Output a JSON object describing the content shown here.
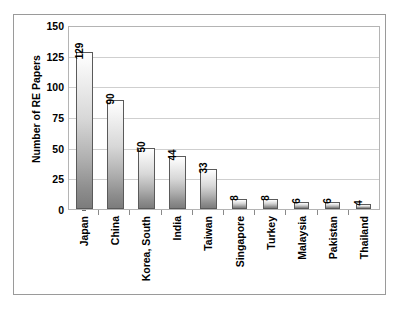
{
  "chart_data": {
    "type": "bar",
    "title": "",
    "subtitle": "",
    "xlabel": "",
    "ylabel": "Number of RE Papers",
    "categories": [
      "Japan",
      "China",
      "Korea, South",
      "India",
      "Taiwan",
      "Singapore",
      "Turkey",
      "Malaysia",
      "Pakistan",
      "Thailand"
    ],
    "values": [
      129,
      90,
      50,
      44,
      33,
      8,
      8,
      6,
      6,
      4
    ],
    "value_labels": [
      "129",
      "90",
      "50",
      "44",
      "33",
      "8",
      "8",
      "6",
      "6",
      "4"
    ],
    "ylim": [
      0,
      150
    ],
    "yticks": [
      0,
      25,
      50,
      75,
      100,
      125,
      150
    ],
    "ytick_labels": [
      "0",
      "25",
      "50",
      "75",
      "100",
      "125",
      "150"
    ],
    "grid": true,
    "grid_axis": "y",
    "legend": false,
    "legend_position": "none",
    "bar_fill": "#d8d8d8",
    "bar_edge": "#5a5a5a",
    "grid_color": "#cfcfcf",
    "plot_border_color": "#b4b4b4",
    "figure_border_color": "#9a9a9a",
    "background": "#ffffff",
    "value_label_rotation": 90,
    "category_label_rotation": 90
  }
}
